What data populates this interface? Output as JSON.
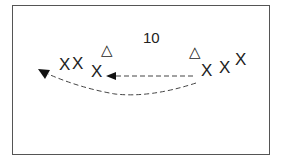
{
  "diagram": {
    "label": "10",
    "players_left": [
      "X",
      "X",
      "X"
    ],
    "players_right": [
      "X",
      "X",
      "X"
    ],
    "cones": [
      "△",
      "△"
    ],
    "arrows": [
      {
        "type": "dashed-straight",
        "from": "right-x",
        "to": "left-x"
      },
      {
        "type": "dashed-curved",
        "from": "right-x",
        "to": "far-left"
      }
    ]
  }
}
